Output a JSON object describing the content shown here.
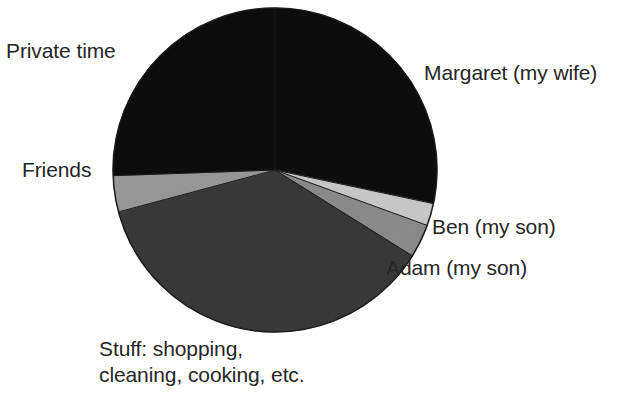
{
  "chart_data": {
    "type": "pie",
    "title": "",
    "subtitle": "",
    "xlabel": "",
    "ylabel": "",
    "legend_position": "none",
    "grid": false,
    "labels_position": "outside",
    "center": {
      "x": 275,
      "y": 170
    },
    "radius": 162,
    "start_angle_deg": 0,
    "direction": "clockwise",
    "categories": [
      "Margaret (my wife)",
      "Ben (my son)",
      "Adam (my son)",
      "Stuff: shopping, cleaning, cooking, etc.",
      "Friends",
      "Private time"
    ],
    "values": [
      28.3,
      2.2,
      3.3,
      37.0,
      3.6,
      25.6
    ],
    "units": "percent",
    "series": [
      {
        "name": "Share of time",
        "values": [
          28.3,
          2.2,
          3.3,
          37.0,
          3.6,
          25.6
        ]
      }
    ],
    "slices": [
      {
        "label": "Margaret (my wife)",
        "value": 28.3,
        "start_deg": 0,
        "end_deg": 102,
        "color": "#111111"
      },
      {
        "label": "Ben (my son)",
        "value": 2.2,
        "start_deg": 102,
        "end_deg": 110,
        "color": "#cbcbcb"
      },
      {
        "label": "Adam (my son)",
        "value": 3.3,
        "start_deg": 110,
        "end_deg": 122,
        "color": "#8d8d8d"
      },
      {
        "label": "Stuff: shopping, cleaning, cooking, etc.",
        "value": 37.0,
        "start_deg": 122,
        "end_deg": 255,
        "color": "#3a3a3a"
      },
      {
        "label": "Friends",
        "value": 3.6,
        "start_deg": 255,
        "end_deg": 268,
        "color": "#9a9a9a"
      },
      {
        "label": "Private time",
        "value": 25.6,
        "start_deg": 268,
        "end_deg": 360,
        "color": "#111111"
      }
    ]
  },
  "labels": {
    "private_time": "Private time",
    "margaret": "Margaret (my wife)",
    "friends": "Friends",
    "ben": "Ben (my son)",
    "adam": "Adam (my son)",
    "stuff_line1": "Stuff: shopping,",
    "stuff_line2": "cleaning, cooking, etc."
  },
  "colors": {
    "background": "#ffffff",
    "text": "#262626",
    "slice_black": "#111111",
    "slice_dark_gray": "#3a3a3a",
    "slice_mid_gray": "#8d8d8d",
    "slice_light_gray": "#cbcbcb",
    "slice_friends_gray": "#9a9a9a",
    "outline": "#1a1a1a"
  }
}
